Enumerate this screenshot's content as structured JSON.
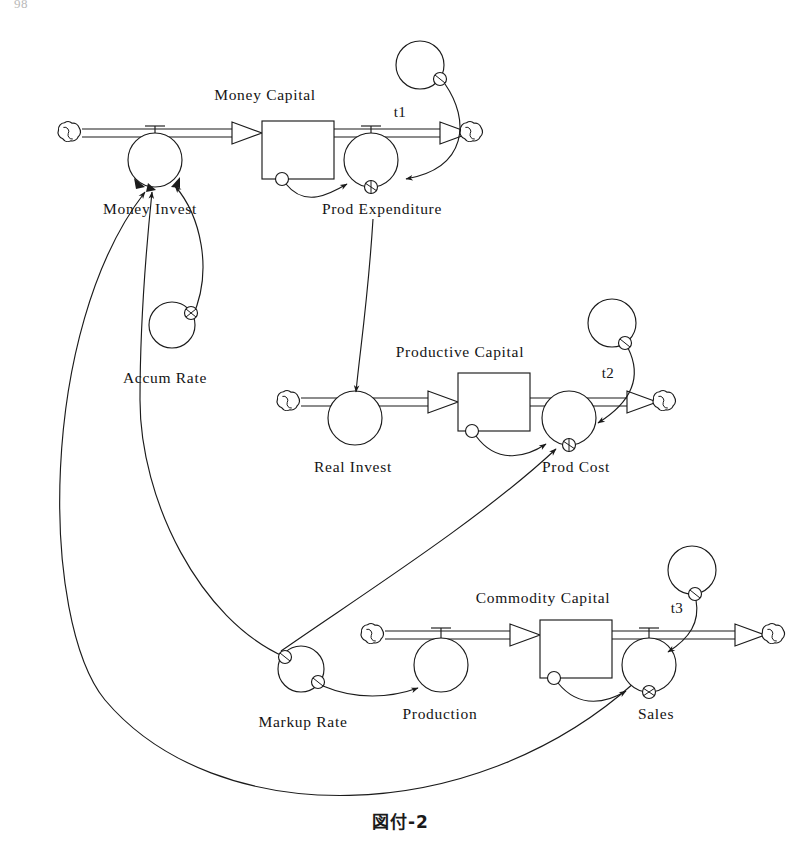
{
  "page": {
    "number": "98",
    "caption": "図付-2"
  },
  "diagram": {
    "type": "system-dynamics-stock-and-flow",
    "stocks": [
      {
        "id": "money_capital",
        "label": "Money Capital",
        "x": 262,
        "y": 150,
        "w": 72,
        "h": 58,
        "label_x": 265,
        "label_y": 100
      },
      {
        "id": "productive_capital",
        "label": "Productive Capital",
        "x": 458,
        "y": 405,
        "w": 72,
        "h": 58,
        "label_x": 460,
        "label_y": 357
      },
      {
        "id": "commodity_capital",
        "label": "Commodity Capital",
        "x": 540,
        "y": 652,
        "w": 72,
        "h": 58,
        "label_x": 543,
        "label_y": 603
      }
    ],
    "flow_valves": [
      {
        "id": "money_invest",
        "label": "Money Invest",
        "cx": 155,
        "cy": 160,
        "r": 27,
        "label_x": 150,
        "label_y": 214
      },
      {
        "id": "prod_expenditure",
        "label": "Prod Expenditure",
        "cx": 371,
        "cy": 160,
        "r": 27,
        "label_x": 382,
        "label_y": 214
      },
      {
        "id": "real_invest",
        "label": "Real Invest",
        "cx": 355,
        "cy": 418,
        "r": 27,
        "label_x": 353,
        "label_y": 472
      },
      {
        "id": "prod_cost",
        "label": "Prod Cost",
        "cx": 569,
        "cy": 418,
        "r": 27,
        "label_x": 576,
        "label_y": 472
      },
      {
        "id": "production",
        "label": "Production",
        "cx": 441,
        "cy": 665,
        "r": 27,
        "label_x": 440,
        "label_y": 719
      },
      {
        "id": "sales",
        "label": "Sales",
        "cx": 649,
        "cy": 665,
        "r": 27,
        "label_x": 656,
        "label_y": 719
      }
    ],
    "auxiliaries": [
      {
        "id": "accum_rate",
        "label": "Accum Rate",
        "cx": 172,
        "cy": 325,
        "r": 23,
        "label_x": 165,
        "label_y": 383
      },
      {
        "id": "markup_rate",
        "label": "Markup Rate",
        "cx": 301,
        "cy": 669,
        "r": 23,
        "label_x": 303,
        "label_y": 727
      },
      {
        "id": "t1",
        "label": "t1",
        "cx": 420,
        "cy": 65,
        "r": 24,
        "label_x": 400,
        "label_y": 117
      },
      {
        "id": "t2",
        "label": "t2",
        "cx": 612,
        "cy": 323,
        "r": 24,
        "label_x": 608,
        "label_y": 378
      },
      {
        "id": "t3",
        "label": "t3",
        "cx": 692,
        "cy": 570,
        "r": 24,
        "label_x": 677,
        "label_y": 613
      }
    ],
    "sources_sinks": [
      {
        "id": "source-money",
        "cx": 68,
        "cy": 133
      },
      {
        "id": "sink-money",
        "cx": 470,
        "cy": 133
      },
      {
        "id": "source-productive",
        "cx": 287,
        "cy": 402
      },
      {
        "id": "sink-productive",
        "cx": 657,
        "cy": 402
      },
      {
        "id": "source-commodity",
        "cx": 371,
        "cy": 635
      },
      {
        "id": "sink-commodity",
        "cx": 765,
        "cy": 635
      }
    ],
    "flows": [
      {
        "id": "money-inflow",
        "from": "source-money",
        "to": "money_capital",
        "valve": "money_invest"
      },
      {
        "id": "money-outflow",
        "from": "money_capital",
        "to": "sink-money",
        "valve": "prod_expenditure"
      },
      {
        "id": "productive-inflow",
        "from": "source-productive",
        "to": "productive_capital",
        "valve": "real_invest"
      },
      {
        "id": "productive-outflow",
        "from": "productive_capital",
        "to": "sink-productive",
        "valve": "prod_cost"
      },
      {
        "id": "commodity-inflow",
        "from": "source-commodity",
        "to": "commodity_capital",
        "valve": "production"
      },
      {
        "id": "commodity-outflow",
        "from": "commodity_capital",
        "to": "sink-commodity",
        "valve": "sales"
      }
    ],
    "links": [
      {
        "id": "link-money-capital-to-prod-expenditure",
        "from": "money_capital",
        "to": "prod_expenditure"
      },
      {
        "id": "link-t1-to-prod-expenditure",
        "from": "t1",
        "to": "prod_expenditure"
      },
      {
        "id": "link-prod-expenditure-to-real-invest",
        "from": "prod_expenditure",
        "to": "real_invest"
      },
      {
        "id": "link-productive-capital-to-prod-cost",
        "from": "productive_capital",
        "to": "prod_cost"
      },
      {
        "id": "link-t2-to-prod-cost",
        "from": "t2",
        "to": "prod_cost"
      },
      {
        "id": "link-prod-cost-to-markup-rate",
        "from": "prod_cost",
        "to": "markup_rate"
      },
      {
        "id": "link-markup-rate-to-production",
        "from": "markup_rate",
        "to": "production"
      },
      {
        "id": "link-commodity-capital-to-sales",
        "from": "commodity_capital",
        "to": "sales"
      },
      {
        "id": "link-t3-to-sales",
        "from": "t3",
        "to": "sales"
      },
      {
        "id": "link-sales-to-money-invest",
        "from": "sales",
        "to": "money_invest"
      },
      {
        "id": "link-markup-rate-to-money-invest",
        "from": "markup_rate",
        "to": "money_invest"
      },
      {
        "id": "link-accum-rate-to-money-invest",
        "from": "accum_rate",
        "to": "money_invest"
      }
    ]
  }
}
